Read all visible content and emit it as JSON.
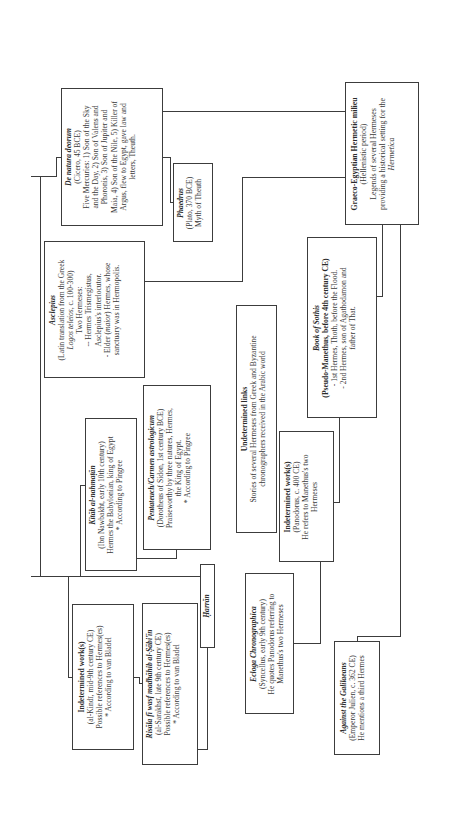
{
  "diagram": {
    "orientation": "rotated-90-ccw",
    "nodes": {
      "de_natura": {
        "title": "De natura deorum",
        "subtitle": "(Cicero, 45 BCE)",
        "lines": [
          "Five Mercuries: 1) Son of the Sky",
          "and the Day, 2) Son of Valens and",
          "Phoronis, 3) Son of Jupiter and",
          "Maia, 4) Son of the Nile, 5) Killer of",
          "Argus, flew to Egypt, gave law and",
          "letters, Theuth."
        ]
      },
      "phaedrus": {
        "title": "Phaedrus",
        "subtitle": "(Plato, 370 BCE)",
        "lines": [
          "Myth of Theuth"
        ]
      },
      "graeco": {
        "title": "Graeco-Egyptian Hermetic milieu",
        "subtitle": "(Hellenistic period)",
        "lines": [
          "Legends of several Hermeses",
          "providing a historical setting for the"
        ],
        "italic_line": "Hermetica"
      },
      "asclepius": {
        "title": "Asclepius",
        "subtitle": "(Latin translation from the Greek",
        "subtitle2_italic": "Logos teleios",
        "subtitle2_rest": ", c. 100-300)",
        "lines": [
          "Two Hermeses:",
          "-- Hermes Trismegistus,",
          "Asclepius's interlocutor.",
          "- Elder ("
        ],
        "italic_word": "maior",
        "lines_after": [
          ") Hermes, whose",
          "sanctuary was in Hermopolis."
        ]
      },
      "sothis": {
        "title": "Book of Sothis",
        "subtitle": "(Pseudo-Manethus, before 4th century CE)",
        "lines": [
          "- 1st Hermes, Thoth, before the Flood.",
          "- 2nd Hermes, son of Agathodamon and",
          "father of That."
        ]
      },
      "undetermined_links": {
        "title": "Undetermined links",
        "lines": [
          "Stories of several Hermeses from Greek and Byzantine",
          "chronographers received in the Arabic world"
        ]
      },
      "pentateuch": {
        "title": "Pentateuch/Carmen astrologicum",
        "subtitle": "(Dorotheus of Sidon, 1st century BCE)",
        "lines": [
          "Praiseworthy by three natures, Hermes,",
          "the King of Egypt.",
          "* According to Pingree"
        ]
      },
      "kitab": {
        "title": "Kitāb al-nahmaṭān",
        "subtitle": "(Ibn Nawbakht, early 10th century)",
        "lines": [
          "Hermes the Babylonian, king of Egypt",
          "* According to Pingree"
        ]
      },
      "panodorus": {
        "title": "Indetermined work(s)",
        "subtitle": "(Panodorus, c. 400 CE)",
        "lines": [
          "He refers to Manethus's two",
          "Hermeses"
        ]
      },
      "harran": {
        "title": "Ḥarrān"
      },
      "alkindi": {
        "title": "Indetermined work(s)",
        "subtitle": "(al-Kindī, mid-9th century CE)",
        "lines": [
          "Possible references to Hermes(es)",
          "* According to van Bladel"
        ]
      },
      "risala": {
        "title": "Risāla fī wasf madhāhib al-Ṣābi'īn",
        "subtitle": "(al-Sarakhsī, late 9th century CE)",
        "lines": [
          "Possible references to Hermes(es)",
          "* According to van Bladel"
        ]
      },
      "ecloga": {
        "title": "Ecloga Chronographica",
        "subtitle": "(Syncellus, early 9th century)",
        "lines": [
          "He quotes Panodorus referring to",
          "Manethus's two Hermeses"
        ]
      },
      "galilaeans": {
        "title": "Against the Galilaeans",
        "subtitle": "(Emperor Julien, c. 362 CE)",
        "lines": [
          "He mentions a third Hermes"
        ]
      }
    },
    "colors": {
      "line": "#3c3c3c",
      "text": "#3a3a3a",
      "background": "#ffffff"
    }
  }
}
